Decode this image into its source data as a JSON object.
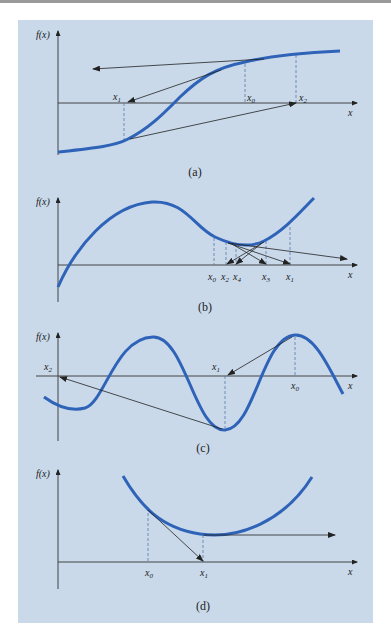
{
  "figure": {
    "background_color": "#c9d9ea",
    "curve_color": "#2e63b8",
    "axis_color": "#333333",
    "panels": [
      {
        "id": "a",
        "caption": "(a)",
        "y_label": "f(x)",
        "x_label": "x",
        "points": [
          "x1",
          "x0",
          "x2"
        ],
        "point_labels": {
          "x0": "x0",
          "x1": "x1",
          "x2": "x2"
        },
        "description": "Inflection point near root causes divergence"
      },
      {
        "id": "b",
        "caption": "(b)",
        "y_label": "f(x)",
        "x_label": "x",
        "points": [
          "x0",
          "x2",
          "x4",
          "x3",
          "x1"
        ],
        "point_labels": {
          "x0": "x0",
          "x2": "x2",
          "x4": "x4",
          "x3": "x3",
          "x1": "x1"
        },
        "description": "Oscillation around local minimum"
      },
      {
        "id": "c",
        "caption": "(c)",
        "y_label": "f(x)",
        "x_label": "x",
        "points": [
          "x2",
          "x1",
          "x0"
        ],
        "point_labels": {
          "x0": "x0",
          "x1": "x1",
          "x2": "x2"
        },
        "description": "Jumping away from root to another root"
      },
      {
        "id": "d",
        "caption": "(d)",
        "y_label": "f(x)",
        "x_label": "x",
        "points": [
          "x0",
          "x1"
        ],
        "point_labels": {
          "x0": "x0",
          "x1": "x1"
        },
        "description": "Zero slope causes division by zero"
      }
    ]
  }
}
